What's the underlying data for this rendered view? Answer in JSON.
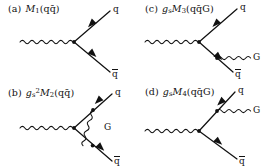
{
  "figure": {
    "background_color": "#ffffff",
    "ink_color": "#111111",
    "panel_count": 4
  },
  "panels": [
    {
      "id": "a",
      "tag": "(a)",
      "amplitude_symbol": "M",
      "amplitude_subscript": "1",
      "coupling_prefactor": "",
      "coupling_subscript": "",
      "coupling_exponent": "",
      "final_state": "(qq̄)",
      "label_plain": "(a)  M₁(qq̄)",
      "legs": [
        {
          "name": "quark",
          "label": "q",
          "barred": false,
          "direction": "outgoing",
          "arrow": "away-from-vertex"
        },
        {
          "name": "antiquark",
          "label": "q",
          "barred": true,
          "direction": "outgoing",
          "arrow": "toward-vertex"
        },
        {
          "name": "current",
          "label": "",
          "barred": false,
          "direction": "incoming",
          "arrow": "none"
        }
      ],
      "gluon": {
        "present": false,
        "label": "",
        "attachment": ""
      },
      "description": "tree-level current to quark antiquark pair"
    },
    {
      "id": "b",
      "tag": "(b)",
      "amplitude_symbol": "M",
      "amplitude_subscript": "2",
      "coupling_prefactor": "g",
      "coupling_subscript": "s",
      "coupling_exponent": "2",
      "final_state": "(qq̄)",
      "label_plain": "(b)  gₛ²M₂(qq̄)",
      "legs": [
        {
          "name": "quark",
          "label": "q",
          "barred": false,
          "direction": "outgoing",
          "arrow": "away-from-vertex"
        },
        {
          "name": "antiquark",
          "label": "q",
          "barred": true,
          "direction": "outgoing",
          "arrow": "toward-vertex"
        },
        {
          "name": "current",
          "label": "",
          "barred": false,
          "direction": "incoming",
          "arrow": "none"
        }
      ],
      "gluon": {
        "present": true,
        "label": "G",
        "attachment": "vertex-correction-loop"
      },
      "description": "one-loop gluon vertex correction"
    },
    {
      "id": "c",
      "tag": "(c)",
      "amplitude_symbol": "M",
      "amplitude_subscript": "3",
      "coupling_prefactor": "g",
      "coupling_subscript": "s",
      "coupling_exponent": "",
      "final_state": "(qq̄G)",
      "label_plain": "(c)  gₛM₃(qq̄G)",
      "legs": [
        {
          "name": "quark",
          "label": "q",
          "barred": false,
          "direction": "outgoing",
          "arrow": "away-from-vertex"
        },
        {
          "name": "antiquark",
          "label": "q",
          "barred": true,
          "direction": "outgoing",
          "arrow": "toward-vertex"
        },
        {
          "name": "current",
          "label": "",
          "barred": false,
          "direction": "incoming",
          "arrow": "none"
        }
      ],
      "gluon": {
        "present": true,
        "label": "G",
        "attachment": "antiquark-leg"
      },
      "description": "real gluon emission from the antiquark leg"
    },
    {
      "id": "d",
      "tag": "(d)",
      "amplitude_symbol": "M",
      "amplitude_subscript": "4",
      "coupling_prefactor": "g",
      "coupling_subscript": "s",
      "coupling_exponent": "",
      "final_state": "(qq̄G)",
      "label_plain": "(d)  gₛM₄(qq̄G)",
      "legs": [
        {
          "name": "quark",
          "label": "q",
          "barred": false,
          "direction": "outgoing",
          "arrow": "away-from-vertex"
        },
        {
          "name": "antiquark",
          "label": "q",
          "barred": true,
          "direction": "outgoing",
          "arrow": "toward-vertex"
        },
        {
          "name": "current",
          "label": "",
          "barred": false,
          "direction": "incoming",
          "arrow": "none"
        }
      ],
      "gluon": {
        "present": true,
        "label": "G",
        "attachment": "quark-leg"
      },
      "description": "real gluon emission from the quark leg"
    }
  ]
}
